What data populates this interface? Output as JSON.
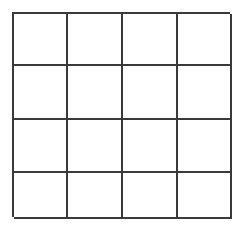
{
  "figure": {
    "type": "grid",
    "rows": 4,
    "columns": 4,
    "cell_count": 16,
    "background_color": "#ffffff",
    "line_color": "#3a3a3a",
    "line_width_px": 2,
    "bounds": {
      "left_px": 12,
      "top_px": 12,
      "right_px": 230,
      "bottom_px": 217,
      "width_px": 218,
      "height_px": 205
    },
    "vertical_line_positions_px": [
      12,
      66,
      121,
      176,
      230
    ],
    "horizontal_line_positions_px": [
      12,
      64,
      118,
      171,
      217
    ],
    "column_widths_px": [
      54,
      55,
      55,
      54
    ],
    "row_heights_px": [
      52,
      54,
      53,
      46
    ],
    "cells": [
      {
        "row": 1,
        "column": 1,
        "label": ""
      },
      {
        "row": 1,
        "column": 2,
        "label": ""
      },
      {
        "row": 1,
        "column": 3,
        "label": ""
      },
      {
        "row": 1,
        "column": 4,
        "label": ""
      },
      {
        "row": 2,
        "column": 1,
        "label": ""
      },
      {
        "row": 2,
        "column": 2,
        "label": ""
      },
      {
        "row": 2,
        "column": 3,
        "label": ""
      },
      {
        "row": 2,
        "column": 4,
        "label": ""
      },
      {
        "row": 3,
        "column": 1,
        "label": ""
      },
      {
        "row": 3,
        "column": 2,
        "label": ""
      },
      {
        "row": 3,
        "column": 3,
        "label": ""
      },
      {
        "row": 3,
        "column": 4,
        "label": ""
      },
      {
        "row": 4,
        "column": 1,
        "label": ""
      },
      {
        "row": 4,
        "column": 2,
        "label": ""
      },
      {
        "row": 4,
        "column": 3,
        "label": ""
      },
      {
        "row": 4,
        "column": 4,
        "label": ""
      }
    ]
  }
}
